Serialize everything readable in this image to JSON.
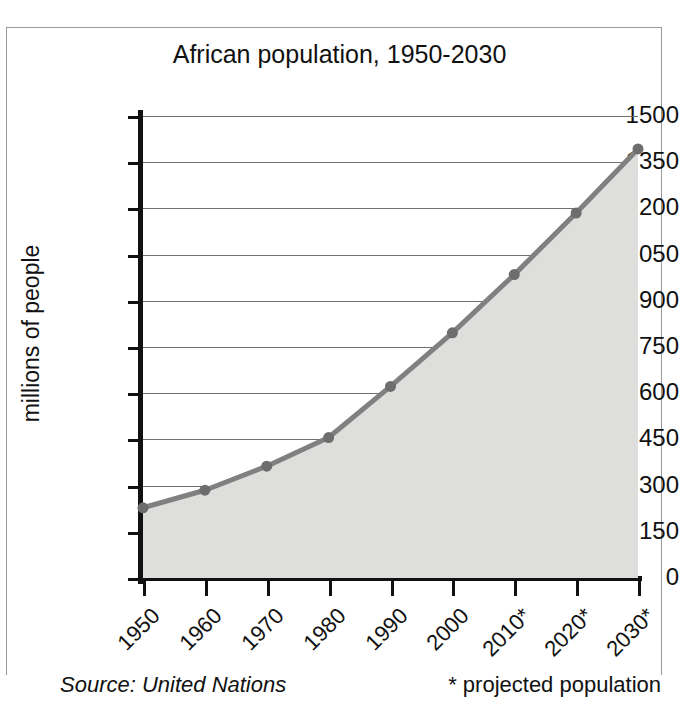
{
  "chart_data": {
    "type": "area",
    "title": "African population, 1950-2030",
    "xlabel": "",
    "ylabel": "millions of people",
    "categories": [
      "1950",
      "1960",
      "1970",
      "1980",
      "1990",
      "2000",
      "2010*",
      "2020*",
      "2030*"
    ],
    "x": [
      1950,
      1960,
      1970,
      1980,
      1990,
      2000,
      2010,
      2020,
      2030
    ],
    "values": [
      228,
      285,
      363,
      456,
      622,
      796,
      985,
      1185,
      1393
    ],
    "series": [
      {
        "name": "African population",
        "values": [
          228,
          285,
          363,
          456,
          622,
          796,
          985,
          1185,
          1393
        ]
      }
    ],
    "ylim": [
      0,
      1500
    ],
    "yticks": [
      0,
      150,
      300,
      450,
      600,
      750,
      900,
      1050,
      1200,
      1350,
      1500
    ],
    "ytick_labels": [
      "0",
      "150",
      "300",
      "450",
      "600",
      "750",
      "900",
      "1050",
      "1200",
      "1350",
      "1500"
    ],
    "grid": true,
    "legend": "none",
    "line_color": "#808080",
    "fill_color": "#dededd",
    "marker_color": "#6d6d6d",
    "axis_color": "#111111",
    "gridline_color": "#6e6e6e",
    "background": "#ffffff"
  },
  "notes": {
    "source": "Source: United Nations",
    "projected": "* projected population"
  }
}
